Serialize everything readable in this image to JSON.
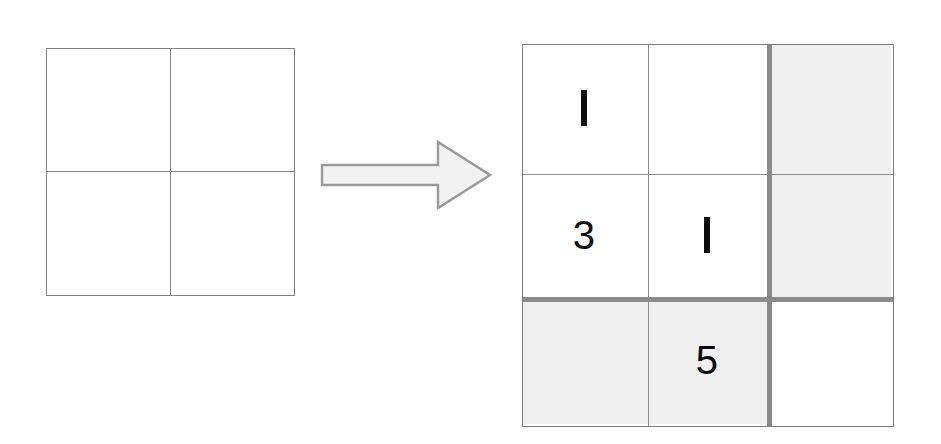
{
  "diagram": {
    "background_color": "#ffffff",
    "line_color": "#8a8a8a",
    "thick_line_color": "#8a8a8a",
    "shaded_cell_color": "#efefef",
    "digit_color": "#0d0d0d"
  },
  "source_grid": {
    "name": "empty-2x2-grid",
    "rows": 2,
    "columns": 2,
    "cells": [
      {
        "value": "",
        "shaded": false
      },
      {
        "value": "",
        "shaded": false
      },
      {
        "value": "",
        "shaded": false
      },
      {
        "value": "",
        "shaded": false
      }
    ]
  },
  "arrow": {
    "name": "transform-arrow",
    "direction": "right",
    "fill_color": "#f2f2f2",
    "stroke_color": "#9a9a9a"
  },
  "result_grid": {
    "name": "filled-3x3-grid",
    "rows": 3,
    "columns": 3,
    "cells": [
      {
        "value": "1",
        "shaded": false
      },
      {
        "value": "",
        "shaded": false
      },
      {
        "value": "",
        "shaded": true
      },
      {
        "value": "3",
        "shaded": false
      },
      {
        "value": "1",
        "shaded": false
      },
      {
        "value": "",
        "shaded": true
      },
      {
        "value": "",
        "shaded": true
      },
      {
        "value": "5",
        "shaded": true
      },
      {
        "value": "",
        "shaded": false
      }
    ],
    "thick_divider_vertical_after_column": 2,
    "thick_divider_horizontal_after_row": 2
  }
}
